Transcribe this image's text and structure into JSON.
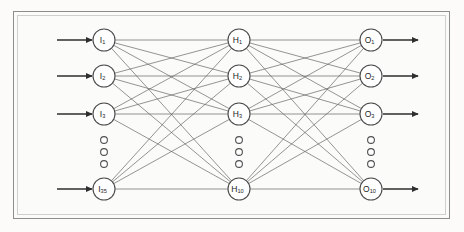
{
  "figure": {
    "background_color": "#fcfbf9",
    "frame_color": "#8d8d8d",
    "node_stroke_color": "#4a4a4a",
    "edge_color": "#5b5b5b",
    "arrow_color": "#2e2e2e"
  },
  "chart_data": {
    "type": "diagram",
    "title": "",
    "layout": "left-to-right feedforward",
    "layers": [
      {
        "id": "input",
        "name": "Input layer",
        "x": 104,
        "prefix": "I",
        "visible_nodes": [
          {
            "label": "I",
            "subscript": "1",
            "text": "I1",
            "y": 40
          },
          {
            "label": "I",
            "subscript": "2",
            "text": "I2",
            "y": 76
          },
          {
            "label": "I",
            "subscript": "3",
            "text": "I3",
            "y": 114
          },
          {
            "label": "I",
            "subscript": "35",
            "text": "I35",
            "y": 189
          }
        ],
        "ellipsis": {
          "y_positions": [
            140,
            152,
            164
          ],
          "count": 3
        },
        "total_units": 35,
        "has_input_arrows": true,
        "has_output_arrows": false
      },
      {
        "id": "hidden",
        "name": "Hidden layer",
        "x": 239,
        "prefix": "H",
        "visible_nodes": [
          {
            "label": "H",
            "subscript": "1",
            "text": "H1",
            "y": 40
          },
          {
            "label": "H",
            "subscript": "2",
            "text": "H2",
            "y": 76
          },
          {
            "label": "H",
            "subscript": "3",
            "text": "H3",
            "y": 114
          },
          {
            "label": "H",
            "subscript": "10",
            "text": "H10",
            "y": 189
          }
        ],
        "ellipsis": {
          "y_positions": [
            140,
            152,
            164
          ],
          "count": 3
        },
        "total_units": 10,
        "has_input_arrows": false,
        "has_output_arrows": false
      },
      {
        "id": "output",
        "name": "Output layer",
        "x": 371,
        "prefix": "O",
        "visible_nodes": [
          {
            "label": "O",
            "subscript": "1",
            "text": "O1",
            "y": 40
          },
          {
            "label": "O",
            "subscript": "2",
            "text": "O2",
            "y": 76
          },
          {
            "label": "O",
            "subscript": "3",
            "text": "O3",
            "y": 114
          },
          {
            "label": "O",
            "subscript": "10",
            "text": "O10",
            "y": 189
          }
        ],
        "ellipsis": {
          "y_positions": [
            140,
            152,
            164
          ],
          "count": 3
        },
        "total_units": 10,
        "has_input_arrows": false,
        "has_output_arrows": true
      }
    ],
    "connections": [
      {
        "from": "input",
        "to": "hidden",
        "style": "fully-connected"
      },
      {
        "from": "hidden",
        "to": "output",
        "style": "fully-connected"
      }
    ],
    "node_radius": 11,
    "ellipsis_radius": 3.4,
    "input_arrow": {
      "x_start": 57,
      "x_end": 92,
      "direction": "right"
    },
    "output_arrow": {
      "x_start": 383,
      "x_end": 418,
      "direction": "right"
    }
  }
}
